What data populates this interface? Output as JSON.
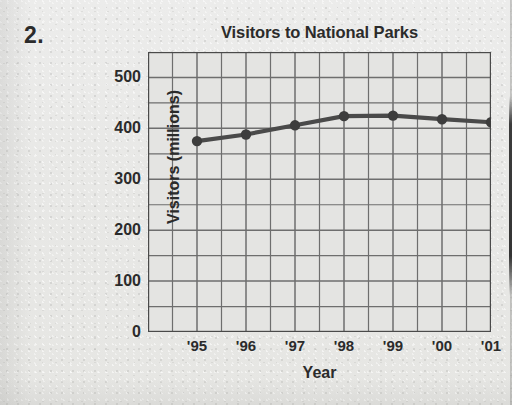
{
  "problem_number": "2.",
  "chart_data": {
    "type": "line",
    "title": "Visitors to National Parks",
    "xlabel": "Year",
    "ylabel": "Visitors (millions)",
    "categories": [
      "'95",
      "'96",
      "'97",
      "'98",
      "'99",
      "'00",
      "'01"
    ],
    "values": [
      375,
      388,
      406,
      424,
      425,
      418,
      412
    ],
    "series": [
      {
        "name": "Visitors",
        "values": [
          375,
          388,
          406,
          424,
          425,
          418,
          412
        ]
      }
    ],
    "ylim": [
      0,
      550
    ],
    "xlim": [
      0,
      7
    ],
    "y_tick_labels": [
      "0",
      "100",
      "200",
      "300",
      "400",
      "500"
    ],
    "y_tick_values": [
      0,
      100,
      200,
      300,
      400,
      500
    ],
    "y_gridline_step": 50,
    "x_gridline_count": 14,
    "grid": true,
    "legend": "none",
    "marker": "filled-circle",
    "line_color": "#4a4a4a",
    "marker_color": "#3d3d3d",
    "grid_color": "#6e6e6e",
    "axis_color": "#4a4a4a",
    "plot_background": "#e4e4e2",
    "page_background": "#e9e9e7"
  }
}
